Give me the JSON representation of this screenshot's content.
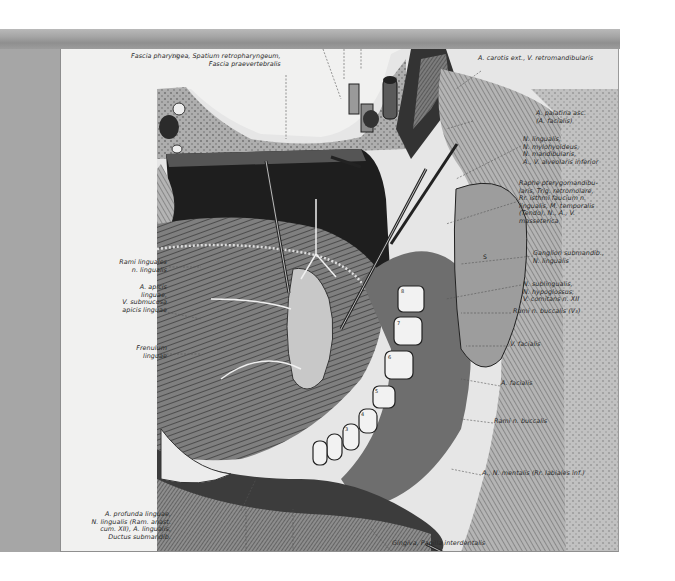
{
  "figure": {
    "plate_number": "14",
    "structure_markers": [
      "R",
      "F1",
      "A",
      "G1",
      "Mm",
      "M",
      "U",
      "U1",
      "V",
      "S",
      "8",
      "7",
      "6",
      "5",
      "4",
      "3",
      "2",
      "1",
      "Q",
      "P"
    ]
  },
  "labels": {
    "top_center": "Fascia pharyngea, Spatium retropharyngeum,\nFascia praevertebralis",
    "carotis": "A. carotis ext., V. retromandibularis",
    "palatina": "A. palatina asc.\n(A. facialis)",
    "lingualis_group": "N. lingualis,\nN. mylohyoideus,\nN. mandibularis,\nA., V. alveolaris inferior",
    "raphe": "Raphe pterygomandibu-\nlaris, Trig. retromolare,\nRr. isthmi faucium n.\nlingualis, M. temporalis\n(Tendo), N., A., V.\nmasseterica",
    "ganglion": "Ganglion submandib.,\nN. lingualis",
    "sublingualis": "N. sublingualis,\nN. hypoglossus,\nV. comitans n. XII",
    "rami_buccalis_v3": "Rami n. buccalis (V₃)",
    "v_facialis": "V. facialis",
    "a_facialis": "A. facialis",
    "rami_buccalis": "Rami n. buccalis",
    "mentalis": "A., N. mentalis (Rr. labiales inf.)",
    "gingiva": "Gingiva, Papilla interdentalis",
    "rami_linguales": "Rami linguales\nn. lingualis",
    "apicis": "A. apicis\nlinguae,\nV. submucosa\napicis linguae",
    "frenulum": "Frenulum\nlinguae",
    "profunda": "A. profunda linguae,\nN. lingualis (Ram. anast.\ncum. XII), A. lingualis,\nDuctus submandib."
  },
  "colors": {
    "frame_bar": "#a3a3a3",
    "side_panel": "#a6a6a6",
    "plate_bg": "#f1f1f0",
    "ink": "#2a2a2a"
  }
}
